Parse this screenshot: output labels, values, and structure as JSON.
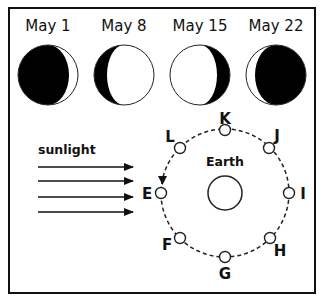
{
  "phases": [
    {
      "date": "May 1",
      "phase": "waxing-crescent",
      "cx": 48,
      "cy": 75
    },
    {
      "date": "May 8",
      "phase": "waxing-gibbous",
      "cx": 124,
      "cy": 75
    },
    {
      "date": "May 15",
      "phase": "waning-gibbous",
      "cx": 200,
      "cy": 75
    },
    {
      "date": "May 22",
      "phase": "waning-crescent",
      "cx": 276,
      "cy": 75
    }
  ],
  "sunlight": {
    "label": "sunlight",
    "arrow_count": 4
  },
  "orbit": {
    "earth_label": "Earth",
    "positions": [
      {
        "label": "K",
        "x": 225,
        "y": 130,
        "lx": 225,
        "ly": 119,
        "anchor": "middle"
      },
      {
        "label": "J",
        "x": 269,
        "y": 148,
        "lx": 276,
        "ly": 137,
        "anchor": "middle"
      },
      {
        "label": "I",
        "x": 289,
        "y": 193,
        "lx": 303,
        "ly": 199,
        "anchor": "middle"
      },
      {
        "label": "H",
        "x": 270,
        "y": 238,
        "lx": 280,
        "ly": 256,
        "anchor": "middle"
      },
      {
        "label": "G",
        "x": 225,
        "y": 257,
        "lx": 225,
        "ly": 278,
        "anchor": "middle"
      },
      {
        "label": "F",
        "x": 180,
        "y": 238,
        "lx": 167,
        "ly": 250,
        "anchor": "middle"
      },
      {
        "label": "E",
        "x": 161,
        "y": 193,
        "lx": 147,
        "ly": 199,
        "anchor": "middle"
      },
      {
        "label": "L",
        "x": 180,
        "y": 148,
        "lx": 170,
        "ly": 144,
        "anchor": "middle"
      }
    ],
    "direction": "counterclockwise"
  }
}
